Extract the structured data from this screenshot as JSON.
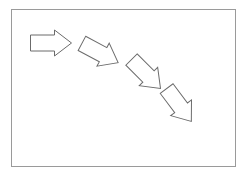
{
  "canvas": {
    "width": 247,
    "height": 180,
    "background_color": "#ffffff",
    "description": "Four outlined block arrows descending diagonally inside a thin rectangular border"
  },
  "border_rect": {
    "name": "border-rectangle",
    "x": 11.5,
    "y": 9.5,
    "width": 224,
    "height": 157,
    "stroke_color": "#9a9a9a",
    "stroke_width": 1,
    "fill": "#ffffff"
  },
  "arrow_style": {
    "stroke_color": "#6b6b6b",
    "stroke_width": 1,
    "fill": "#ffffff",
    "linejoin": "miter"
  },
  "arrows": [
    {
      "id": "arrow-1",
      "label": "Arrow 1",
      "direction": "right",
      "rotation_deg": 0,
      "center_x": 51,
      "center_y": 43,
      "length": 41,
      "shaft_height": 16,
      "head_height": 26,
      "head_length": 17
    },
    {
      "id": "arrow-2",
      "label": "Arrow 2",
      "direction": "down-right",
      "rotation_deg": 28,
      "center_x": 100,
      "center_y": 53,
      "length": 41,
      "shaft_height": 16,
      "head_height": 26,
      "head_length": 17
    },
    {
      "id": "arrow-3",
      "label": "Arrow 3",
      "direction": "down-right",
      "rotation_deg": 45,
      "center_x": 146,
      "center_y": 74,
      "length": 41,
      "shaft_height": 16,
      "head_height": 26,
      "head_length": 17
    },
    {
      "id": "arrow-4",
      "label": "Arrow 4",
      "direction": "down-right",
      "rotation_deg": 53,
      "center_x": 179,
      "center_y": 105,
      "length": 41,
      "shaft_height": 16,
      "head_height": 26,
      "head_length": 17
    }
  ]
}
